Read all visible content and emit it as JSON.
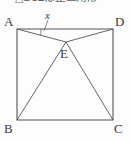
{
  "header": {
    "text": "△BCEは正三角形",
    "note": "cropped partial line of text at top edge"
  },
  "figure": {
    "stroke_color": "#555555",
    "background_color": "#fdfdfd",
    "square": {
      "vertices": [
        {
          "id": "A",
          "label": "A",
          "x": 17,
          "y": 29,
          "label_x": 4,
          "label_y": 16
        },
        {
          "id": "D",
          "label": "D",
          "x": 113,
          "y": 29,
          "label_x": 115,
          "label_y": 16
        },
        {
          "id": "C",
          "label": "C",
          "x": 113,
          "y": 120,
          "label_x": 114,
          "label_y": 122
        },
        {
          "id": "B",
          "label": "B",
          "x": 17,
          "y": 120,
          "label_x": 4,
          "label_y": 122
        }
      ]
    },
    "interior_point": {
      "id": "E",
      "label": "E",
      "x": 66,
      "y": 42,
      "label_x": 60,
      "label_y": 47
    },
    "segments": [
      {
        "from": "A",
        "to": "E"
      },
      {
        "from": "D",
        "to": "E"
      },
      {
        "from": "B",
        "to": "E"
      },
      {
        "from": "C",
        "to": "E"
      }
    ],
    "angle_marker": {
      "at_vertex": "A",
      "label": "x",
      "label_x": 45,
      "label_y": 11,
      "leader_from_x": 48,
      "leader_from_y": 20,
      "leader_to_x": 44,
      "leader_to_y": 32
    }
  }
}
